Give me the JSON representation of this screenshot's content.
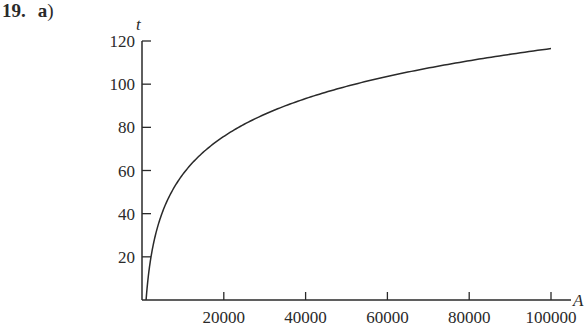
{
  "heading": {
    "number": "19.",
    "part": "a",
    "paren": ")"
  },
  "chart_data": {
    "type": "line",
    "title": "",
    "xlabel": "A",
    "ylabel": "t",
    "xlim": [
      0,
      100000
    ],
    "ylim": [
      0,
      120
    ],
    "grid": false,
    "legend": null,
    "x_ticks": [
      20000,
      40000,
      60000,
      80000,
      100000
    ],
    "x_tick_labels": [
      "20000",
      "40000",
      "60000",
      "80000",
      "100000"
    ],
    "y_ticks": [
      20,
      40,
      60,
      80,
      100,
      120
    ],
    "y_tick_labels": [
      "20",
      "40",
      "60",
      "80",
      "100",
      "120"
    ],
    "series": [
      {
        "name": "t(A)",
        "color": "#2a2a2a",
        "x": [
          1000,
          1500,
          2000,
          3000,
          5000,
          7500,
          10000,
          15000,
          20000,
          30000,
          40000,
          50000,
          60000,
          70000,
          80000,
          90000,
          100000
        ],
        "y": [
          0,
          10.3,
          17.5,
          27.8,
          40.7,
          51.0,
          58.3,
          68.5,
          75.8,
          86.1,
          93.3,
          99.0,
          103.6,
          107.5,
          110.9,
          113.8,
          116.5
        ]
      }
    ]
  }
}
